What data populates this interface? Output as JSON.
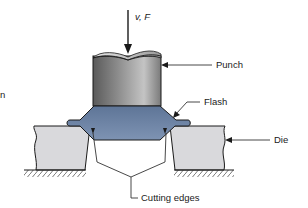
{
  "diagram": {
    "type": "mechanical-cross-section",
    "labels": {
      "force": "v, F",
      "punch": "Punch",
      "flash": "Flash",
      "die": "Die",
      "cutting_edges": "Cutting edges",
      "left_edge_fragment": "n"
    },
    "colors": {
      "punch_dark": "#4a4a4a",
      "punch_light": "#b8b8b8",
      "workpiece": "#6f86a8",
      "workpiece_dark": "#4f6384",
      "die_fill": "#d9d9dc",
      "outline": "#1a1a1a",
      "leader": "#333333"
    },
    "components": [
      {
        "name": "punch",
        "shape": "cylinder",
        "label": "Punch"
      },
      {
        "name": "workpiece",
        "shape": "forged part with flash",
        "label": "Flash"
      },
      {
        "name": "die-left",
        "shape": "block",
        "label": "Die"
      },
      {
        "name": "die-right",
        "shape": "block",
        "label": "Die"
      },
      {
        "name": "cutting-edges",
        "count": 2,
        "label": "Cutting edges"
      }
    ]
  }
}
